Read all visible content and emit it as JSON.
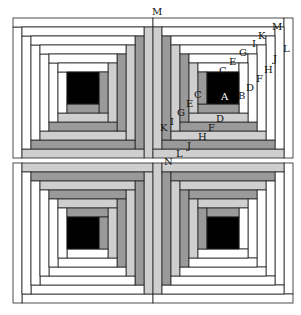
{
  "diagram": {
    "colors": {
      "center": "#000000",
      "white": "#ffffff",
      "dark": "#9a9a9a",
      "light": "#cfcfcf",
      "stroke": "#222222"
    },
    "block_size": 140,
    "strip": 9,
    "rings": 6,
    "blocks": [
      {
        "name": "block-top-left",
        "x": 13,
        "y": 18,
        "rotate": 270
      },
      {
        "name": "block-top-right",
        "x": 153,
        "y": 18,
        "rotate": 0
      },
      {
        "name": "block-bottom-left",
        "x": 13,
        "y": 163,
        "rotate": 180
      },
      {
        "name": "block-bottom-right",
        "x": 153,
        "y": 163,
        "rotate": 90
      }
    ],
    "labels": [
      {
        "text": "A",
        "x": 221,
        "y": 100,
        "white": true
      },
      {
        "text": "B",
        "x": 238,
        "y": 99
      },
      {
        "text": "C",
        "x": 219,
        "y": 74
      },
      {
        "text": "C",
        "x": 194,
        "y": 98
      },
      {
        "text": "D",
        "x": 246,
        "y": 91
      },
      {
        "text": "D",
        "x": 216,
        "y": 122
      },
      {
        "text": "E",
        "x": 229,
        "y": 65
      },
      {
        "text": "E",
        "x": 186,
        "y": 107
      },
      {
        "text": "F",
        "x": 256,
        "y": 82
      },
      {
        "text": "F",
        "x": 208,
        "y": 131
      },
      {
        "text": "G",
        "x": 239,
        "y": 56
      },
      {
        "text": "G",
        "x": 177,
        "y": 116
      },
      {
        "text": "H",
        "x": 264,
        "y": 73
      },
      {
        "text": "H",
        "x": 198,
        "y": 140
      },
      {
        "text": "I",
        "x": 252,
        "y": 47
      },
      {
        "text": "I",
        "x": 170,
        "y": 125
      },
      {
        "text": "J",
        "x": 273,
        "y": 62
      },
      {
        "text": "J",
        "x": 187,
        "y": 149
      },
      {
        "text": "K",
        "x": 258,
        "y": 39
      },
      {
        "text": "K",
        "x": 160,
        "y": 131
      },
      {
        "text": "L",
        "x": 283,
        "y": 52
      },
      {
        "text": "L",
        "x": 176,
        "y": 157
      },
      {
        "text": "M",
        "x": 272,
        "y": 30
      },
      {
        "text": "M",
        "x": 152,
        "y": 15
      },
      {
        "text": "N",
        "x": 164,
        "y": 165
      }
    ]
  }
}
